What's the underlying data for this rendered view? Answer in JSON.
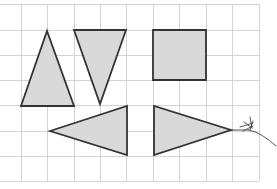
{
  "diagram": {
    "type": "grid-shapes",
    "background_color": "#ffffff",
    "grid": {
      "line_color": "#d4d4d4",
      "x_lines": [
        21,
        47,
        74,
        100,
        126,
        153,
        179,
        206,
        232,
        259
      ],
      "y_lines": [
        4,
        30,
        55,
        80,
        105,
        131,
        156,
        181
      ],
      "x_extent": [
        0,
        259
      ],
      "y_extent": [
        4,
        181
      ]
    },
    "shape_style": {
      "fill": "#d9d9d9",
      "stroke": "#333333",
      "stroke_width": 1.8
    },
    "shapes": [
      {
        "name": "triangle-up",
        "kind": "triangle",
        "points": [
          [
            47,
            31
          ],
          [
            21,
            106
          ],
          [
            74,
            106
          ]
        ]
      },
      {
        "name": "triangle-down",
        "kind": "triangle",
        "points": [
          [
            74,
            30
          ],
          [
            126,
            30
          ],
          [
            100,
            104
          ]
        ]
      },
      {
        "name": "square",
        "kind": "square",
        "points": [
          [
            153,
            30
          ],
          [
            206,
            30
          ],
          [
            206,
            80
          ],
          [
            153,
            80
          ]
        ]
      },
      {
        "name": "triangle-left",
        "kind": "triangle",
        "points": [
          [
            50,
            131
          ],
          [
            127,
            106
          ],
          [
            127,
            155
          ]
        ]
      },
      {
        "name": "triangle-right",
        "kind": "triangle",
        "points": [
          [
            154,
            106
          ],
          [
            154,
            155
          ],
          [
            231,
            130
          ]
        ]
      }
    ],
    "scribble": {
      "name": "pencil-scribble",
      "color": "#444444",
      "paths": [
        "M231,130 L249,130",
        "M249,130 Q262,133 276,146",
        "M240,127 L253,123",
        "M244,122 L252,128",
        "M250,117 L252,128",
        "M253,121 L250,130",
        "M243,131 L253,126"
      ]
    }
  }
}
